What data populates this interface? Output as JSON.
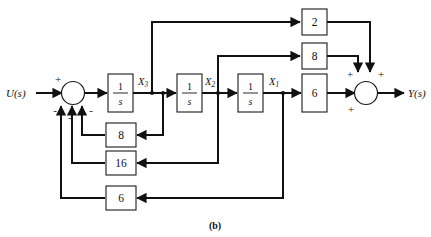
{
  "figure": {
    "caption": "(b)"
  },
  "io": {
    "input_label": "U(s)",
    "output_label": "Y(s)"
  },
  "state_labels": {
    "x3": "X3",
    "x2": "X2",
    "x1": "X1"
  },
  "integrators": [
    {
      "name": "integrator-1",
      "numerator": "1",
      "denominator": "s",
      "output_signal": "X3"
    },
    {
      "name": "integrator-2",
      "numerator": "1",
      "denominator": "s",
      "output_signal": "X2"
    },
    {
      "name": "integrator-3",
      "numerator": "1",
      "denominator": "s",
      "output_signal": "X1"
    }
  ],
  "feedforward_gains": [
    {
      "name": "gain-2",
      "label": "2",
      "source": "X3",
      "target": "output-sum"
    },
    {
      "name": "gain-8-top",
      "label": "8",
      "source": "X2",
      "target": "output-sum"
    },
    {
      "name": "gain-6-forward",
      "label": "6",
      "source": "X1",
      "target": "output-sum"
    }
  ],
  "feedback_gains": [
    {
      "name": "gain-8-feedback",
      "label": "8",
      "source": "X3",
      "target": "input-sum"
    },
    {
      "name": "gain-16-feedback",
      "label": "16",
      "source": "X2",
      "target": "input-sum"
    },
    {
      "name": "gain-6-feedback",
      "label": "6",
      "source": "X1",
      "target": "input-sum"
    }
  ],
  "input_sum": {
    "name": "input-summing-junction",
    "signs": [
      "+",
      "-",
      "-",
      "-"
    ],
    "plus": "+",
    "minus": "-"
  },
  "output_sum": {
    "name": "output-summing-junction",
    "signs": [
      "+",
      "+",
      "+"
    ],
    "plus": "+"
  },
  "colors": {
    "wire": "#111111",
    "block_stroke": "#1a1a1a",
    "background": "#ffffff"
  }
}
